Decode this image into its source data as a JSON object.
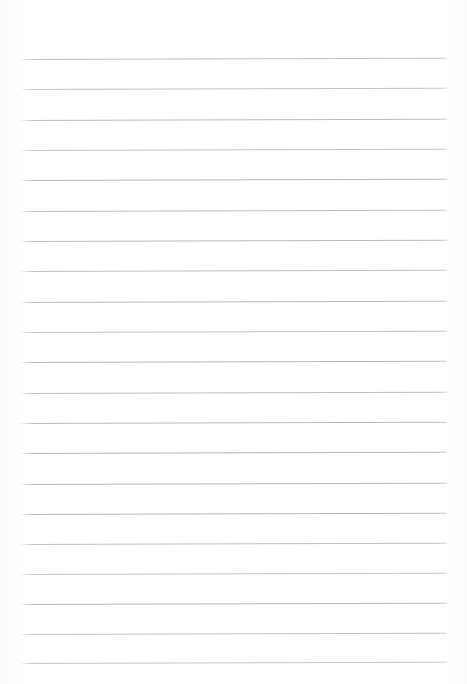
{
  "document": {
    "kind": "scanned-lined-paper",
    "title": "",
    "page_width": 467,
    "page_height": 684,
    "background_color": "#ffffff",
    "visible_text": "",
    "text_content_present": false
  },
  "ruling": {
    "line_color": "#9a9a9a",
    "line_thickness_px": 1,
    "line_count": 21,
    "left_margin_px": 20,
    "right_margin_px": 20,
    "line_start_x": 20,
    "line_end_x": 447,
    "line_length_px": 427,
    "first_line_y": 59,
    "line_spacing_px": 30.3,
    "slant_degrees": -0.18,
    "lines": [
      {
        "index": 1,
        "y": 59,
        "opacity": 0.62
      },
      {
        "index": 2,
        "y": 89,
        "opacity": 0.58
      },
      {
        "index": 3,
        "y": 120,
        "opacity": 0.66
      },
      {
        "index": 4,
        "y": 150,
        "opacity": 0.6
      },
      {
        "index": 5,
        "y": 180,
        "opacity": 0.7
      },
      {
        "index": 6,
        "y": 211,
        "opacity": 0.64
      },
      {
        "index": 7,
        "y": 241,
        "opacity": 0.68
      },
      {
        "index": 8,
        "y": 271,
        "opacity": 0.62
      },
      {
        "index": 9,
        "y": 302,
        "opacity": 0.66
      },
      {
        "index": 10,
        "y": 332,
        "opacity": 0.6
      },
      {
        "index": 11,
        "y": 362,
        "opacity": 0.7
      },
      {
        "index": 12,
        "y": 393,
        "opacity": 0.64
      },
      {
        "index": 13,
        "y": 423,
        "opacity": 0.68
      },
      {
        "index": 14,
        "y": 453,
        "opacity": 0.72
      },
      {
        "index": 15,
        "y": 484,
        "opacity": 0.66
      },
      {
        "index": 16,
        "y": 514,
        "opacity": 0.7
      },
      {
        "index": 17,
        "y": 544,
        "opacity": 0.62
      },
      {
        "index": 18,
        "y": 574,
        "opacity": 0.58
      },
      {
        "index": 19,
        "y": 604,
        "opacity": 0.66
      },
      {
        "index": 20,
        "y": 634,
        "opacity": 0.6
      },
      {
        "index": 21,
        "y": 663,
        "opacity": 0.55
      }
    ]
  }
}
